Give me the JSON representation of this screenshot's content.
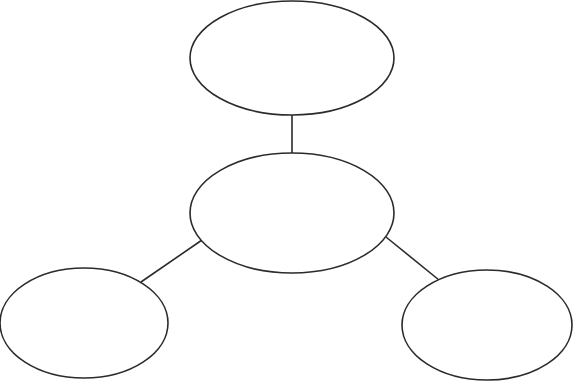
{
  "diagram": {
    "type": "concept-map",
    "stroke_color": "#2b2b2b",
    "background": "#ffffff",
    "nodes": [
      {
        "id": "top",
        "label": "",
        "cx": 292,
        "cy": 58,
        "rx": 102,
        "ry": 57
      },
      {
        "id": "center",
        "label": "",
        "cx": 292,
        "cy": 213,
        "rx": 102,
        "ry": 60
      },
      {
        "id": "bottom-left",
        "label": "",
        "cx": 84,
        "cy": 323,
        "rx": 84,
        "ry": 55
      },
      {
        "id": "bottom-right",
        "label": "",
        "cx": 487,
        "cy": 325,
        "rx": 85,
        "ry": 55
      }
    ],
    "edges": [
      {
        "from": "top",
        "to": "center"
      },
      {
        "from": "center",
        "to": "bottom-left"
      },
      {
        "from": "center",
        "to": "bottom-right"
      }
    ]
  }
}
